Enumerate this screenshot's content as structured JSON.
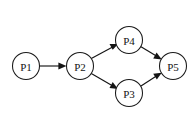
{
  "diagram": {
    "type": "directed-graph",
    "title": "",
    "background_color": "#ffffff",
    "stroke_color": "#141414",
    "node_fill_color": "#ffffff",
    "canvas": {
      "width": 194,
      "height": 116
    },
    "node_radius": 13.5,
    "nodes": [
      {
        "id": "P1",
        "label": "P1",
        "cx": 26,
        "cy": 66
      },
      {
        "id": "P2",
        "label": "P2",
        "cx": 80,
        "cy": 66
      },
      {
        "id": "P4",
        "label": "P4",
        "cx": 129,
        "cy": 40
      },
      {
        "id": "P3",
        "label": "P3",
        "cx": 129,
        "cy": 93
      },
      {
        "id": "P5",
        "label": "P5",
        "cx": 173,
        "cy": 66
      }
    ],
    "edges": [
      {
        "from": "P1",
        "to": "P2",
        "directed": true,
        "style": "solid"
      },
      {
        "from": "P2",
        "to": "P4",
        "directed": true,
        "style": "solid"
      },
      {
        "from": "P2",
        "to": "P3",
        "directed": true,
        "style": "solid"
      },
      {
        "from": "P4",
        "to": "P5",
        "directed": true,
        "style": "solid"
      },
      {
        "from": "P3",
        "to": "P5",
        "directed": true,
        "style": "solid"
      }
    ]
  }
}
